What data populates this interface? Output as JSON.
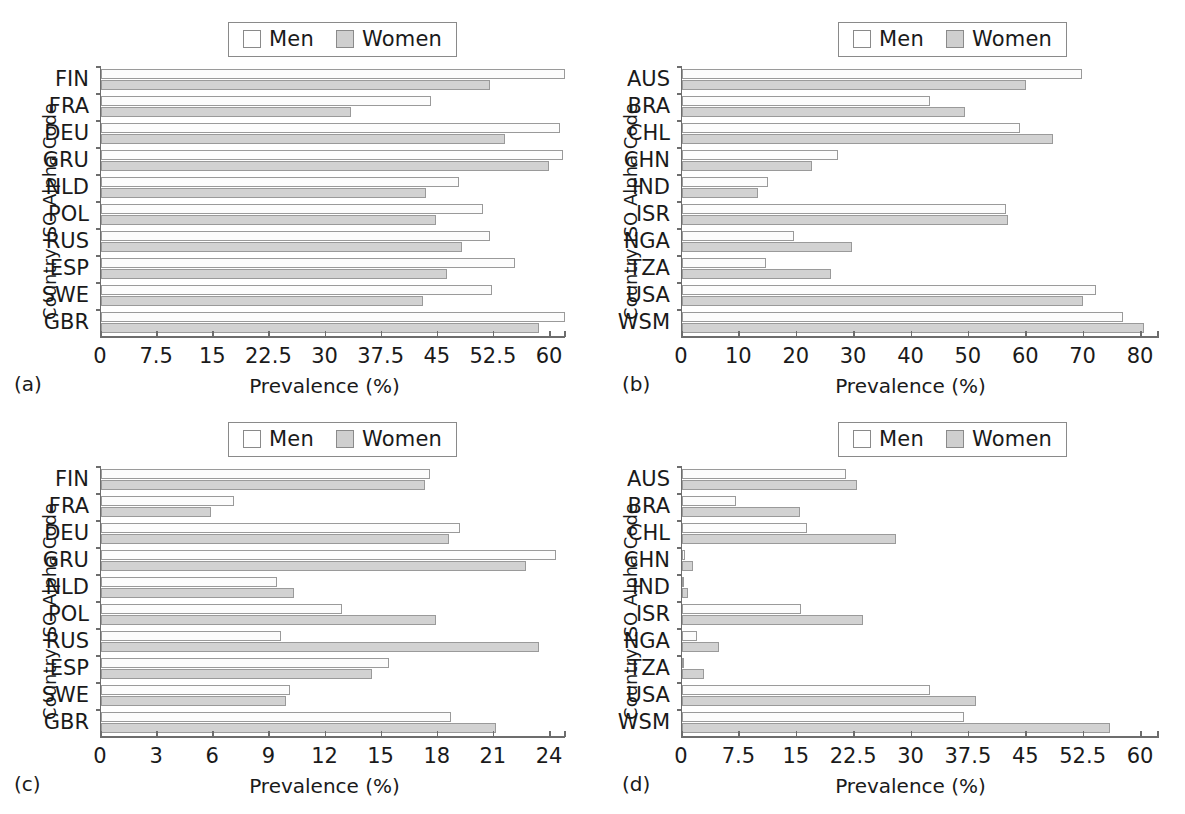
{
  "figure": {
    "axis_titles": {
      "y": "Country ISO Alpha Code",
      "x": "Prevalence (%)"
    },
    "legend": {
      "men": "Men",
      "women": "Women"
    },
    "panel_labels": {
      "a": "(a)",
      "b": "(b)",
      "c": "(c)",
      "d": "(d)"
    }
  },
  "chart_data": [
    {
      "id": "a",
      "type": "bar",
      "orientation": "horizontal",
      "panel_label": "(a)",
      "title": "",
      "xlabel": "Prevalence (%)",
      "ylabel": "Country ISO Alpha Code",
      "xlim": [
        0,
        60
      ],
      "xticks": [
        0,
        7.5,
        15,
        22.5,
        30,
        37.5,
        45,
        52.5,
        60
      ],
      "xticklabels": [
        "0",
        "7.5",
        "15",
        "22.5",
        "30",
        "37.5",
        "45",
        "52.5",
        "60"
      ],
      "grid": false,
      "legend_position": "top-center",
      "categories": [
        "FIN",
        "FRA",
        "DEU",
        "GRU",
        "NLD",
        "POL",
        "RUS",
        "ESP",
        "SWE",
        "GBR"
      ],
      "series": [
        {
          "name": "Men",
          "values": [
            62.0,
            44.1,
            61.3,
            61.7,
            47.9,
            51.0,
            52.0,
            55.3,
            52.2,
            62.0
          ]
        },
        {
          "name": "Women",
          "values": [
            52.0,
            33.4,
            54.0,
            59.8,
            43.4,
            44.8,
            48.3,
            46.2,
            43.0,
            58.5
          ]
        }
      ]
    },
    {
      "id": "b",
      "type": "bar",
      "orientation": "horizontal",
      "panel_label": "(b)",
      "title": "",
      "xlabel": "Prevalence (%)",
      "ylabel": "Country ISO Alpha Code",
      "xlim": [
        0,
        80
      ],
      "xticks": [
        0,
        10,
        20,
        30,
        40,
        50,
        60,
        70,
        80
      ],
      "xticklabels": [
        "0",
        "10",
        "20",
        "30",
        "40",
        "50",
        "60",
        "70",
        "80"
      ],
      "grid": false,
      "legend_position": "top-center",
      "categories": [
        "AUS",
        "BRA",
        "CHL",
        "CHN",
        "IND",
        "ISR",
        "NGA",
        "TZA",
        "USA",
        "WSM"
      ],
      "series": [
        {
          "name": "Men",
          "values": [
            69.7,
            43.2,
            58.9,
            27.2,
            15.0,
            56.4,
            19.5,
            14.6,
            72.1,
            76.8
          ]
        },
        {
          "name": "Women",
          "values": [
            60.0,
            49.3,
            64.6,
            22.6,
            13.2,
            56.8,
            29.6,
            26.0,
            69.9,
            80.6
          ]
        }
      ]
    },
    {
      "id": "c",
      "type": "bar",
      "orientation": "horizontal",
      "panel_label": "(c)",
      "title": "",
      "xlabel": "Prevalence (%)",
      "ylabel": "Country ISO Alpha Code",
      "xlim": [
        0,
        24
      ],
      "xticks": [
        0,
        3,
        6,
        9,
        12,
        15,
        18,
        21,
        24
      ],
      "xticklabels": [
        "0",
        "3",
        "6",
        "9",
        "12",
        "15",
        "18",
        "21",
        "24"
      ],
      "grid": false,
      "legend_position": "top-center",
      "categories": [
        "FIN",
        "FRA",
        "DEU",
        "GRU",
        "NLD",
        "POL",
        "RUS",
        "ESP",
        "SWE",
        "GBR"
      ],
      "series": [
        {
          "name": "Men",
          "values": [
            17.6,
            7.1,
            19.2,
            24.3,
            9.4,
            12.9,
            9.6,
            15.4,
            10.1,
            18.7
          ]
        },
        {
          "name": "Women",
          "values": [
            17.3,
            5.9,
            18.6,
            22.7,
            10.3,
            17.9,
            23.4,
            14.5,
            9.9,
            21.1
          ]
        }
      ]
    },
    {
      "id": "d",
      "type": "bar",
      "orientation": "horizontal",
      "panel_label": "(d)",
      "title": "",
      "xlabel": "Prevalence (%)",
      "ylabel": "Country ISO Alpha Code",
      "xlim": [
        0,
        60
      ],
      "xticks": [
        0,
        7.5,
        15,
        22.5,
        30,
        37.5,
        45,
        52.5,
        60
      ],
      "xticklabels": [
        "0",
        "7.5",
        "15",
        "22.5",
        "30",
        "37.5",
        "45",
        "52.5",
        "60"
      ],
      "grid": false,
      "legend_position": "top-center",
      "categories": [
        "AUS",
        "BRA",
        "CHL",
        "CHN",
        "IND",
        "ISR",
        "NGA",
        "TZA",
        "USA",
        "WSM"
      ],
      "series": [
        {
          "name": "Men",
          "values": [
            21.5,
            7.1,
            16.4,
            0.4,
            0.3,
            15.6,
            1.9,
            0.3,
            32.4,
            36.9
          ]
        },
        {
          "name": "Women",
          "values": [
            22.9,
            15.4,
            28.0,
            1.5,
            0.8,
            23.7,
            4.9,
            2.9,
            38.4,
            56.0
          ]
        }
      ]
    }
  ],
  "colors": {
    "men_fill": "#fcfcfc",
    "women_fill": "#d2d2d2",
    "bar_stroke": "#9a9a9a",
    "axis": "#6d6d6d",
    "text": "#1a1a1a"
  }
}
